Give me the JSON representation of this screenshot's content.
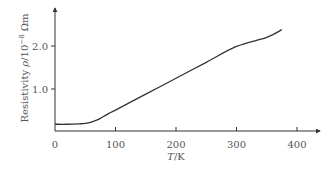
{
  "chart_data": {
    "type": "line",
    "title": "",
    "xlabel": "T/K",
    "xlabel_italic_part": "T",
    "xlabel_rest": "/K",
    "ylabel": "Resistivity ρ/10⁻⁸ Ωm",
    "ylabel_prefix": "Resistivity ",
    "ylabel_italic_part": "ρ",
    "ylabel_mid": "/10",
    "ylabel_exp": "−8",
    "ylabel_unit": " Ωm",
    "xlim": [
      0,
      430
    ],
    "ylim": [
      0,
      2.75
    ],
    "x_ticks": [
      0,
      100,
      200,
      300,
      400
    ],
    "x_tick_labels": [
      "0",
      "100",
      "200",
      "300",
      "400"
    ],
    "y_ticks": [
      1.0,
      2.0
    ],
    "y_tick_labels": [
      "1.0",
      "2.0"
    ],
    "grid": false,
    "legend": null,
    "series": [
      {
        "name": "Resistivity",
        "x": [
          0,
          20,
          40,
          50,
          60,
          70,
          80,
          90,
          100,
          150,
          200,
          250,
          300,
          350,
          375
        ],
        "values": [
          0.18,
          0.18,
          0.19,
          0.2,
          0.23,
          0.28,
          0.36,
          0.44,
          0.51,
          0.88,
          1.25,
          1.62,
          1.99,
          2.2,
          2.38
        ]
      }
    ],
    "color": "#333333"
  }
}
